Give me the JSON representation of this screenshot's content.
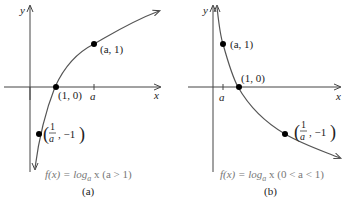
{
  "panels": [
    {
      "id": "a",
      "caption_func": "f(x) = log",
      "caption_sub": "a",
      "caption_rest": " x (a > 1)",
      "panel_label": "(a)",
      "axis_x_label": "x",
      "axis_y_label": "y",
      "tick_label": "a",
      "points": [
        {
          "label": "(a, 1)"
        },
        {
          "label": "(1, 0)"
        },
        {
          "label_num": "1",
          "label_den": "a",
          "label_rest": ", −1"
        }
      ]
    },
    {
      "id": "b",
      "caption_func": "f(x) = log",
      "caption_sub": "a",
      "caption_rest": " x (0 < a < 1)",
      "panel_label": "(b)",
      "axis_x_label": "x",
      "axis_y_label": "y",
      "tick_label": "a",
      "points": [
        {
          "label": "(a, 1)"
        },
        {
          "label": "(1, 0)"
        },
        {
          "label_num": "1",
          "label_den": "a",
          "label_rest": ", −1"
        }
      ]
    }
  ],
  "colors": {
    "axis": "#444444",
    "curve": "#555555",
    "point": "#000000",
    "caption": "#777777"
  }
}
